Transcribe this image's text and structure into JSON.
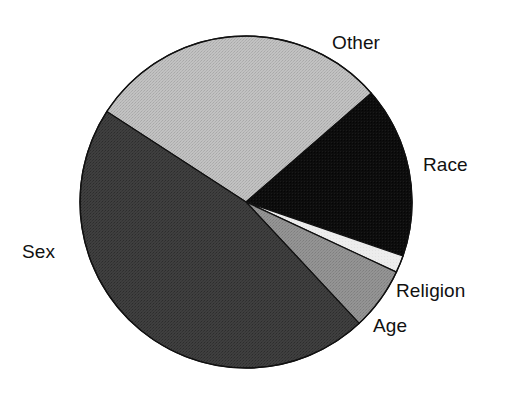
{
  "chart_data": {
    "type": "pie",
    "title": "",
    "subtitle": "",
    "xlabel": "",
    "ylabel": "",
    "legend_position": "none",
    "grid": false,
    "labels_position": "outside",
    "categories": [
      "Other",
      "Race",
      "Religion",
      "Age",
      "Sex"
    ],
    "values": [
      29,
      17,
      2,
      6,
      46
    ],
    "units": "percent",
    "start_angle_deg": -147,
    "direction": "clockwise",
    "slices": [
      {
        "label": "Other",
        "value": 29,
        "color": "#b8b8b8",
        "fill_style": "light-gray-dither",
        "start_angle_deg": -147,
        "end_angle_deg": -41
      },
      {
        "label": "Race",
        "value": 17,
        "color": "#0d0d0d",
        "fill_style": "black",
        "start_angle_deg": -41,
        "end_angle_deg": 19
      },
      {
        "label": "Religion",
        "value": 2,
        "color": "#ededed",
        "fill_style": "white",
        "start_angle_deg": 19,
        "end_angle_deg": 25
      },
      {
        "label": "Age",
        "value": 6,
        "color": "#8f8f8f",
        "fill_style": "medium-gray-dither",
        "start_angle_deg": 25,
        "end_angle_deg": 47
      },
      {
        "label": "Sex",
        "value": 46,
        "color": "#3b3b3b",
        "fill_style": "dark-gray-dither",
        "start_angle_deg": 47,
        "end_angle_deg": 213
      }
    ],
    "geometry": {
      "center_x": 246,
      "center_y": 202,
      "radius": 166
    }
  },
  "figure": {
    "background_color": "#ffffff",
    "outline_color": "#111111",
    "label_color": "#111111"
  },
  "labels": {
    "other": "Other",
    "race": "Race",
    "religion": "Religion",
    "age": "Age",
    "sex": "Sex"
  }
}
